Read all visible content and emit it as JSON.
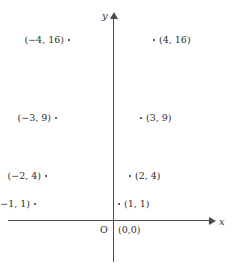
{
  "chart_data": {
    "type": "scatter",
    "title": "",
    "xlabel": "x",
    "ylabel": "y",
    "grid": false,
    "legend": null,
    "origin_letter": "O",
    "points": [
      {
        "label": "(−4, 16)",
        "x": -4,
        "y": 16,
        "side": "left",
        "dot_x": 73,
        "dot_y": 41,
        "text_right": 70,
        "text_top": 35
      },
      {
        "label": "(4, 16)",
        "x": 4,
        "y": 16,
        "side": "right",
        "dot_x": 155,
        "dot_y": 41,
        "text_left": 153,
        "text_top": 35
      },
      {
        "label": "(−3, 9)",
        "x": -3,
        "y": 9,
        "side": "left",
        "dot_x": 86,
        "dot_y": 119,
        "text_right": 57,
        "text_top": 113
      },
      {
        "label": "(3, 9)",
        "x": 3,
        "y": 9,
        "side": "right",
        "dot_x": 142,
        "dot_y": 119,
        "text_left": 140,
        "text_top": 113
      },
      {
        "label": "(−2, 4)",
        "x": -2,
        "y": 4,
        "side": "left",
        "dot_x": 96,
        "dot_y": 177,
        "text_right": 47,
        "text_top": 171
      },
      {
        "label": "(2, 4)",
        "x": 2,
        "y": 4,
        "side": "right",
        "dot_x": 131,
        "dot_y": 177,
        "text_left": 129,
        "text_top": 171
      },
      {
        "label": "(−1, 1)",
        "x": -1,
        "y": 1,
        "side": "left",
        "dot_x": 107,
        "dot_y": 205,
        "text_right": 36,
        "text_top": 199
      },
      {
        "label": "(1, 1)",
        "x": 1,
        "y": 1,
        "side": "right",
        "dot_x": 120,
        "dot_y": 205,
        "text_left": 118,
        "text_top": 199
      }
    ],
    "origin_point_label": "(0,0)",
    "axis_color": "#4a4a4a",
    "text_color": "#2e2e2e",
    "background": "#ffffff"
  },
  "axes": {
    "x_name": "x",
    "y_name": "y"
  }
}
